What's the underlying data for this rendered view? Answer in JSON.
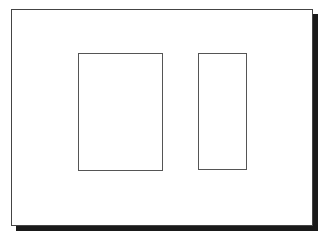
{
  "diagram": {
    "frame": {
      "label": ""
    },
    "panels": [
      {
        "name": "left-panel",
        "label": ""
      },
      {
        "name": "right-panel",
        "label": ""
      }
    ],
    "colors": {
      "frame_border": "#444444",
      "panel_border": "#555555",
      "shadow": "#1a1a1a",
      "background": "#ffffff"
    }
  }
}
